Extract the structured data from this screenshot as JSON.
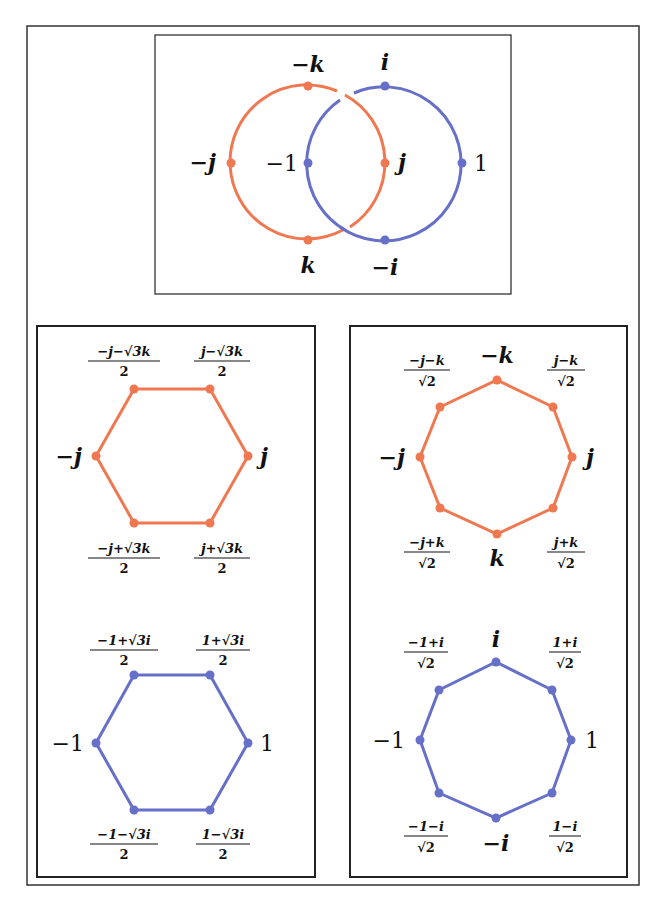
{
  "colors": {
    "orange": "#f07850",
    "blue": "#6670c8",
    "frame": "#333333"
  },
  "top_panel": {
    "orange_circle": {
      "labels": {
        "top": "−k",
        "left": "−j",
        "right": "j",
        "bottom": "k"
      }
    },
    "blue_circle": {
      "labels": {
        "top": "i",
        "left": "−1",
        "right": "1",
        "bottom": "−i"
      }
    }
  },
  "hex_orange": {
    "left": "−j",
    "right": "j",
    "top_left": {
      "num": "−j−√3k",
      "den": "2"
    },
    "top_right": {
      "num": "j−√3k",
      "den": "2"
    },
    "bottom_left": {
      "num": "−j+√3k",
      "den": "2"
    },
    "bottom_right": {
      "num": "j+√3k",
      "den": "2"
    }
  },
  "hex_blue": {
    "left": "−1",
    "right": "1",
    "top_left": {
      "num": "−1+√3i",
      "den": "2"
    },
    "top_right": {
      "num": "1+√3i",
      "den": "2"
    },
    "bottom_left": {
      "num": "−1−√3i",
      "den": "2"
    },
    "bottom_right": {
      "num": "1−√3i",
      "den": "2"
    }
  },
  "oct_orange": {
    "top": "−k",
    "bottom": "k",
    "left": "−j",
    "right": "j",
    "top_left": {
      "num": "−j−k",
      "den": "√2"
    },
    "top_right": {
      "num": "j−k",
      "den": "√2"
    },
    "bottom_left": {
      "num": "−j+k",
      "den": "√2"
    },
    "bottom_right": {
      "num": "j+k",
      "den": "√2"
    }
  },
  "oct_blue": {
    "top": "i",
    "bottom": "−i",
    "left": "−1",
    "right": "1",
    "top_left": {
      "num": "−1+i",
      "den": "√2"
    },
    "top_right": {
      "num": "1+i",
      "den": "√2"
    },
    "bottom_left": {
      "num": "−1−i",
      "den": "√2"
    },
    "bottom_right": {
      "num": "1−i",
      "den": "√2"
    }
  }
}
